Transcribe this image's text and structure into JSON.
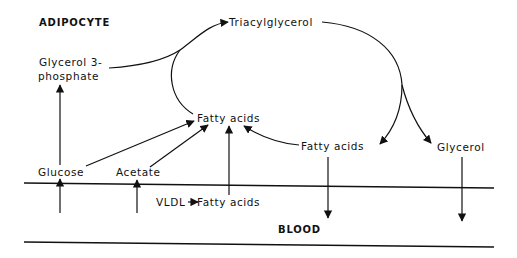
{
  "diagram": {
    "title": "ADIPOCYTE",
    "compartment_bottom": "BLOOD",
    "nodes": {
      "triacylglycerol": "Triacylglycerol",
      "glycerol3p_line1": "Glycerol 3-",
      "glycerol3p_line2": "phosphate",
      "fatty_acids_center": "Fatty acids",
      "fatty_acids_right": "Fatty acids",
      "glycerol": "Glycerol",
      "glucose": "Glucose",
      "acetate": "Acetate",
      "vldl": "VLDL",
      "vldl_fatty_acids": "Fatty acids"
    },
    "edges": [
      {
        "from": "Glycerol 3-phosphate",
        "to": "Triacylglycerol"
      },
      {
        "from": "Fatty acids",
        "to": "Triacylglycerol"
      },
      {
        "from": "Triacylglycerol",
        "to": "Fatty acids (released)"
      },
      {
        "from": "Triacylglycerol",
        "to": "Glycerol"
      },
      {
        "from": "Fatty acids (released)",
        "to": "Fatty acids (re-esterified)"
      },
      {
        "from": "Glucose",
        "to": "Glycerol 3-phosphate"
      },
      {
        "from": "Glucose",
        "to": "Fatty acids"
      },
      {
        "from": "Acetate",
        "to": "Fatty acids"
      },
      {
        "from": "VLDL",
        "to": "Fatty acids"
      },
      {
        "from": "Blood",
        "to": "Glucose"
      },
      {
        "from": "Blood",
        "to": "Acetate"
      },
      {
        "from": "Fatty acids (released)",
        "to": "Blood"
      },
      {
        "from": "Glycerol",
        "to": "Blood"
      }
    ]
  }
}
